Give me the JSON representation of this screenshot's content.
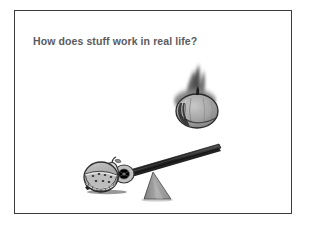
{
  "slide": {
    "title": "How does stuff work in real life?",
    "background_color": "#ffffff",
    "frame_border_color": "#3b3b3d",
    "title_color": "#5a5a5e"
  },
  "illustration": {
    "caption": "A heavy pumpkin falls toward a lever loaded with fruit balanced on a triangular fulcrum",
    "objects": [
      {
        "name": "falling-pumpkin",
        "label": "Pumpkin",
        "description": "Motion-blurred pumpkin falling from above with a short stem on top",
        "fill_color": "#9a9a9a",
        "outline_color": "#1f1f1f",
        "blur": true
      },
      {
        "name": "fruit-pile",
        "label": "Fruit pile",
        "description": "Watermelon slice, pear and orange resting on the low end of the lever",
        "items": [
          {
            "name": "watermelon",
            "label": "Watermelon",
            "fill_color": "#b4b4b4"
          },
          {
            "name": "pear",
            "label": "Pear",
            "fill_color": "#d0d0d0"
          },
          {
            "name": "orange",
            "label": "Orange",
            "fill_color": "#c2c2c2"
          }
        ]
      },
      {
        "name": "lever-board",
        "label": "Lever board",
        "description": "Long dark plank tilted up to the right",
        "fill_color": "#2b2b2b"
      },
      {
        "name": "fulcrum",
        "label": "Fulcrum",
        "description": "Grey triangular wedge supporting the lever",
        "fill_color": "#9d9d9d",
        "shadow_color": "#3a3a3a"
      }
    ]
  }
}
